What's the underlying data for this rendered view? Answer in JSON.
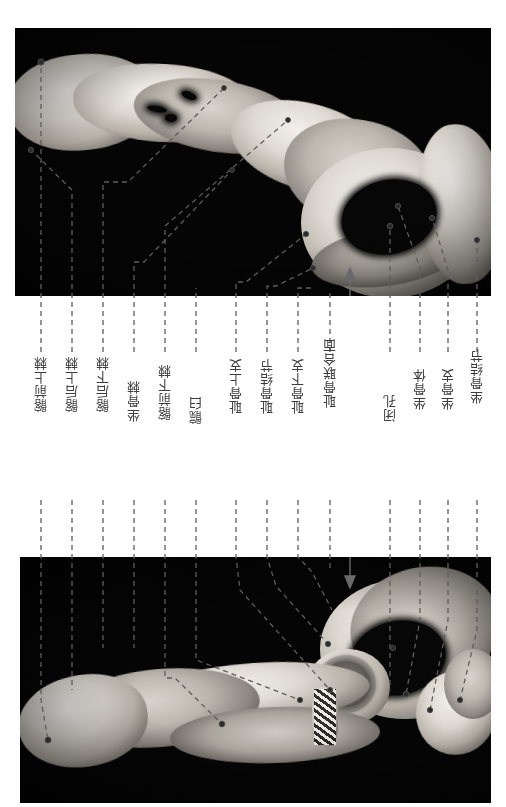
{
  "figure": {
    "type": "anatomical-photograph-plate",
    "orientation": "page rotated 90 degrees; labels read vertically",
    "panels": [
      {
        "id": "top",
        "name": "hip-bone-medial-view",
        "caption": ""
      },
      {
        "id": "bottom",
        "name": "hip-bone-lateral-view",
        "caption": ""
      }
    ]
  },
  "labels": [
    {
      "id": "l1",
      "text": "髂前上棘",
      "pinyin": "iliac anterior superior spine"
    },
    {
      "id": "l2",
      "text": "髂后上棘",
      "pinyin": "iliac posterior superior spine"
    },
    {
      "id": "l3",
      "text": "髂后下棘",
      "pinyin": "iliac posterior inferior spine"
    },
    {
      "id": "l4",
      "text": "坐骨棘",
      "pinyin": "ischial spine"
    },
    {
      "id": "l5",
      "text": "髂前下棘",
      "pinyin": "iliac anterior inferior spine"
    },
    {
      "id": "l6",
      "text": "髋臼",
      "pinyin": "acetabulum"
    },
    {
      "id": "l7",
      "text": "耻骨上支",
      "pinyin": "superior pubic ramus"
    },
    {
      "id": "l8",
      "text": "耻骨结节",
      "pinyin": "pubic tubercle"
    },
    {
      "id": "l9",
      "text": "耻骨下支",
      "pinyin": "inferior pubic ramus"
    },
    {
      "id": "l10",
      "text": "耻骨联合面",
      "pinyin": "symphysial surface of pubis"
    },
    {
      "id": "l11",
      "text": "闭孔",
      "pinyin": "obturator foramen"
    },
    {
      "id": "l12",
      "text": "坐骨体",
      "pinyin": "body of ischium"
    },
    {
      "id": "l13",
      "text": "坐骨支",
      "pinyin": "ramus of ischium"
    },
    {
      "id": "l14",
      "text": "坐骨结节",
      "pinyin": "ischial tuberosity"
    }
  ],
  "colors": {
    "page_background": "#fefefe",
    "plate_background": "#050505",
    "leader_line": "#5d5d5d",
    "label_text": "#3c3c3c"
  }
}
